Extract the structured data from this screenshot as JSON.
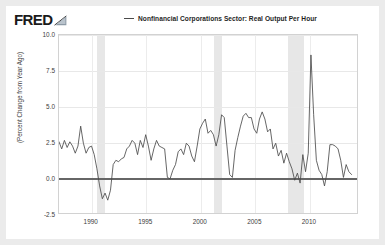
{
  "header": {
    "logo_text": "FRED",
    "logo_icon": "fred-swoosh-icon"
  },
  "legend": {
    "entries": [
      {
        "label": "Nonfinancial Corporations Sector: Real Output Per Hour",
        "color": "#4a4a4a"
      }
    ]
  },
  "chart_data": {
    "type": "line",
    "title": "Nonfinancial Corporations Sector: Real Output Per Hour",
    "xlabel": "",
    "ylabel": "(Percent Change from Year Ago)",
    "xlim": [
      1987.0,
      2014.5
    ],
    "ylim": [
      -2.5,
      10.0
    ],
    "grid": true,
    "legend_position": "top",
    "yticks": [
      "10.0",
      "7.5",
      "5.0",
      "2.5",
      "0.0",
      "-2.5"
    ],
    "ytick_values": [
      10.0,
      7.5,
      5.0,
      2.5,
      0.0,
      -2.5
    ],
    "xticks": [
      "1990",
      "1995",
      "2000",
      "2005",
      "2010"
    ],
    "xtick_values": [
      1990,
      1995,
      2000,
      2005,
      2010
    ],
    "zero_line": 0.0,
    "line_color": "#4a4a4a",
    "recession_color": "#e3e3e3",
    "recession_bands": [
      {
        "start": 1990.5,
        "end": 1991.25
      },
      {
        "start": 2001.25,
        "end": 2001.9
      },
      {
        "start": 2007.95,
        "end": 2009.5
      }
    ],
    "series": [
      {
        "name": "Nonfinancial Corporations Sector: Real Output Per Hour",
        "x": [
          1987.0,
          1987.25,
          1987.5,
          1987.75,
          1988.0,
          1988.25,
          1988.5,
          1988.75,
          1989.0,
          1989.25,
          1989.5,
          1989.75,
          1990.0,
          1990.25,
          1990.5,
          1990.75,
          1991.0,
          1991.25,
          1991.5,
          1991.75,
          1992.0,
          1992.25,
          1992.5,
          1992.75,
          1993.0,
          1993.25,
          1993.5,
          1993.75,
          1994.0,
          1994.25,
          1994.5,
          1994.75,
          1995.0,
          1995.25,
          1995.5,
          1995.75,
          1996.0,
          1996.25,
          1996.5,
          1996.75,
          1997.0,
          1997.25,
          1997.5,
          1997.75,
          1998.0,
          1998.25,
          1998.5,
          1998.75,
          1999.0,
          1999.25,
          1999.5,
          1999.75,
          2000.0,
          2000.25,
          2000.5,
          2000.75,
          2001.0,
          2001.25,
          2001.5,
          2001.75,
          2002.0,
          2002.25,
          2002.5,
          2002.75,
          2003.0,
          2003.25,
          2003.5,
          2003.75,
          2004.0,
          2004.25,
          2004.5,
          2004.75,
          2005.0,
          2005.25,
          2005.5,
          2005.75,
          2006.0,
          2006.25,
          2006.5,
          2006.75,
          2007.0,
          2007.25,
          2007.5,
          2007.75,
          2008.0,
          2008.25,
          2008.5,
          2008.75,
          2009.0,
          2009.25,
          2009.5,
          2009.75,
          2010.0,
          2010.25,
          2010.5,
          2010.75,
          2011.0,
          2011.25,
          2011.5,
          2011.75,
          2012.0,
          2012.25,
          2012.5,
          2012.75,
          2013.0,
          2013.25,
          2013.5,
          2013.75,
          2014.0
        ],
        "y": [
          2.5,
          2.0,
          2.6,
          2.1,
          2.5,
          2.2,
          1.7,
          2.2,
          3.6,
          2.4,
          1.7,
          2.1,
          2.2,
          1.6,
          0.6,
          -0.6,
          -1.5,
          -1.1,
          -1.6,
          -0.9,
          0.9,
          1.2,
          1.1,
          1.3,
          1.4,
          2.0,
          2.2,
          2.6,
          2.4,
          1.6,
          2.6,
          2.1,
          3.0,
          2.2,
          1.2,
          2.0,
          2.6,
          2.2,
          2.1,
          2.0,
          0.0,
          -0.1,
          0.5,
          0.9,
          1.8,
          2.0,
          1.6,
          2.4,
          2.2,
          1.5,
          1.1,
          2.2,
          3.4,
          3.8,
          4.1,
          3.1,
          3.3,
          3.0,
          2.2,
          3.0,
          4.4,
          4.2,
          2.2,
          0.2,
          0.0,
          1.9,
          2.8,
          3.6,
          4.3,
          4.5,
          4.2,
          4.2,
          3.4,
          3.1,
          4.1,
          4.6,
          4.1,
          3.2,
          3.4,
          2.0,
          2.4,
          1.5,
          1.9,
          1.0,
          1.7,
          1.1,
          0.6,
          -0.2,
          0.3,
          -0.4,
          1.6,
          0.4,
          1.7,
          8.6,
          4.4,
          1.2,
          0.5,
          0.2,
          -0.6,
          0.4,
          2.3,
          2.3,
          2.2,
          2.0,
          1.2,
          0.0,
          0.9,
          0.4,
          0.2
        ]
      }
    ]
  },
  "axis": {
    "ylabel": "(Percent Change from Year Ago)"
  }
}
